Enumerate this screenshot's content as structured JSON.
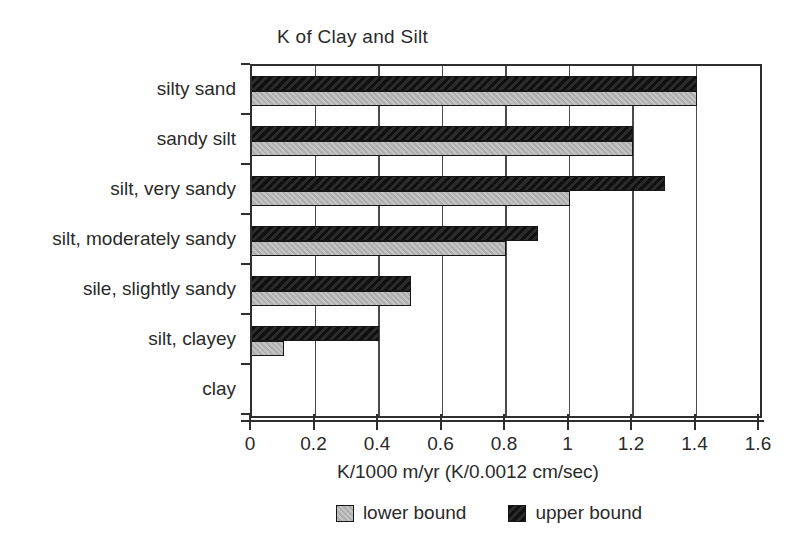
{
  "chart_data": {
    "type": "bar",
    "orientation": "horizontal",
    "title": "K of Clay and Silt",
    "categories": [
      "silty sand",
      "sandy silt",
      "silt, very sandy",
      "silt, moderately sandy",
      "sile, slightly sandy",
      "silt, clayey",
      "clay"
    ],
    "series": [
      {
        "name": "lower bound",
        "color": "#b9b9b9",
        "values": [
          1.4,
          1.2,
          1.0,
          0.8,
          0.5,
          0.1,
          0
        ]
      },
      {
        "name": "upper bound",
        "color": "#1c1c1c",
        "values": [
          1.4,
          1.2,
          1.3,
          0.9,
          0.5,
          0.4,
          0
        ]
      }
    ],
    "xlabel": "K/1000 m/yr (K/0.0012 cm/sec)",
    "xlim": [
      0,
      1.6
    ],
    "xticks": [
      0,
      0.2,
      0.4,
      0.6,
      0.8,
      1,
      1.2,
      1.4,
      1.6
    ],
    "xtick_labels": [
      "0",
      "0.2",
      "0.4",
      "0.6",
      "0.8",
      "1",
      "1.2",
      "1.4",
      "1.6"
    ],
    "grid": true,
    "legend_position": "bottom"
  }
}
